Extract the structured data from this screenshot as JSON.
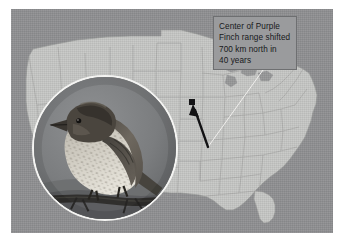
{
  "figure": {
    "background_color": "#ffffff",
    "plate_color": "#8f9092",
    "land_color": "#c6c7c5",
    "border_color": "#8a8b8d"
  },
  "callout": {
    "name": "range-shift-callout",
    "background_color": "#9a9b9d",
    "border_color": "#6e6f71",
    "text_color": "#17181a",
    "lines": [
      "Center of Purple",
      "Finch range shifted",
      "700 km north in",
      "40 years"
    ],
    "full_text": "Center of Purple Finch range shifted 700 km north in 40 years"
  },
  "annotation": {
    "leader_line": {
      "name": "callout-leader-line",
      "color": "#f0efed",
      "from": [
        263,
        70
      ],
      "to": [
        208,
        147
      ]
    },
    "shift_arrow": {
      "name": "range-shift-arrow",
      "color": "#121214",
      "tail": [
        208,
        147
      ],
      "head": [
        193,
        107
      ],
      "direction": "north-northwest",
      "distance_label": "700 km"
    },
    "range_center_marker": {
      "name": "range-center-marker",
      "color": "#141416",
      "position": [
        192,
        102
      ]
    }
  },
  "inset": {
    "name": "purple-finch-photo",
    "subject": "Purple Finch perched on a branch",
    "shape": "circle",
    "center": [
      98,
      139
    ],
    "radius": 73,
    "ring_color": "#f4f4f2",
    "photo_background": "#787a7c"
  },
  "map": {
    "name": "united-states-map",
    "region": "Contiguous United States",
    "style": "grayscale outline with state boundaries",
    "ocean_color": "#8f9092",
    "land_color": "#c6c7c5",
    "stroke_color": "#8f9093"
  }
}
